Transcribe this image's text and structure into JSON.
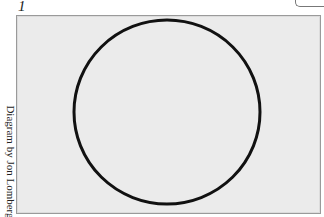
{
  "figure": {
    "number": "1",
    "credit": "Diagram by Jon Lomberg",
    "shape": "circle-outline",
    "colors": {
      "background": "#ebebeb",
      "stroke": "#111111",
      "border": "#9a9a9a"
    }
  }
}
